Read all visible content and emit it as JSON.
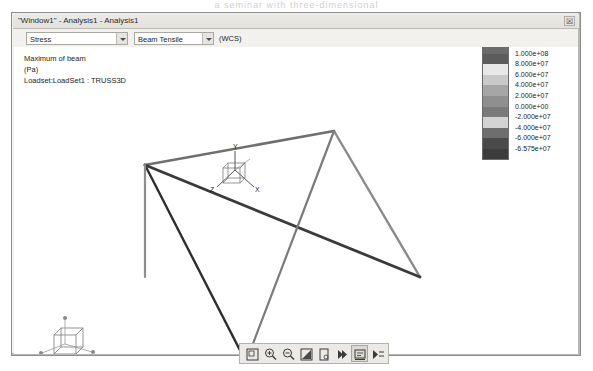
{
  "page": {
    "faint_header": "a seminar with three-dimensional"
  },
  "window": {
    "title": "\"Window1\" - Analysis1 - Analysis1",
    "close_label": "☒"
  },
  "controls": {
    "quantity": {
      "value": "Stress",
      "arrow_icon": "chevron-down-icon"
    },
    "component": {
      "value": "Beam Tensile",
      "arrow_icon": "chevron-down-icon"
    },
    "coord_system": "(WCS)"
  },
  "info": {
    "lines": [
      "Maximum of beam",
      "(Pa)",
      "Loadset:LoadSet1 : TRUSS3D"
    ]
  },
  "legend": {
    "title": "",
    "bands": [
      {
        "label": "1.149e+08",
        "color": "#6b6b6b"
      },
      {
        "label": "1.000e+08",
        "color": "#5c5c5c"
      },
      {
        "label": "8.000e+07",
        "color": "#e8e8e8"
      },
      {
        "label": "6.000e+07",
        "color": "#c9c9c9"
      },
      {
        "label": "4.000e+07",
        "color": "#a6a6a6"
      },
      {
        "label": "2.000e+07",
        "color": "#8f8f8f"
      },
      {
        "label": "0.000e+00",
        "color": "#7a7a7a"
      },
      {
        "label": "-2.000e+07",
        "color": "#d3d3d3"
      },
      {
        "label": "-4.000e+07",
        "color": "#6e6e6e"
      },
      {
        "label": "-6.000e+07",
        "color": "#4a4a4a"
      },
      {
        "label": "-6.575e+07",
        "color": "#3c3c3c"
      }
    ]
  },
  "viewport": {
    "triad": {
      "x_label": "X",
      "y_label": "Y",
      "z_label": "Z"
    },
    "orientation_widget": "view-orientation-cube"
  },
  "model": {
    "name": "TRUSS3D",
    "nodes": {
      "left": [
        131,
        118
      ],
      "top_apex": [
        320,
        84
      ],
      "right": [
        406,
        230
      ],
      "bottom_apex": [
        232,
        315
      ],
      "left_base": [
        131,
        230
      ]
    },
    "members": [
      {
        "from": "left",
        "to": "top_apex",
        "color": "#6f6f6f",
        "width": 2.6
      },
      {
        "from": "top_apex",
        "to": "right",
        "color": "#8a8a8a",
        "width": 2.4
      },
      {
        "from": "left",
        "to": "right",
        "color": "#3a3a3a",
        "width": 2.8
      },
      {
        "from": "left",
        "to": "bottom_apex",
        "color": "#2e2e2e",
        "width": 2.4
      },
      {
        "from": "bottom_apex",
        "to": "top_apex",
        "color": "#7a7a7a",
        "width": 2.2
      },
      {
        "from": "left",
        "to": "left_base",
        "color": "#8e8e8e",
        "width": 2.2
      }
    ]
  },
  "toolbar": {
    "buttons": [
      {
        "name": "zoom-box-icon",
        "label": "Zoom to box",
        "pressed": false
      },
      {
        "name": "zoom-in-icon",
        "label": "Zoom in",
        "pressed": false
      },
      {
        "name": "zoom-out-icon",
        "label": "Zoom out",
        "pressed": false
      },
      {
        "name": "refit-icon",
        "label": "Refit",
        "pressed": false
      },
      {
        "name": "repaint-icon",
        "label": "Repaint",
        "pressed": false
      },
      {
        "name": "animate-icon",
        "label": "Animate",
        "pressed": false
      },
      {
        "name": "query-icon",
        "label": "Query",
        "pressed": true
      },
      {
        "name": "dynamic-query-icon",
        "label": "Dynamic query",
        "pressed": false
      }
    ]
  }
}
